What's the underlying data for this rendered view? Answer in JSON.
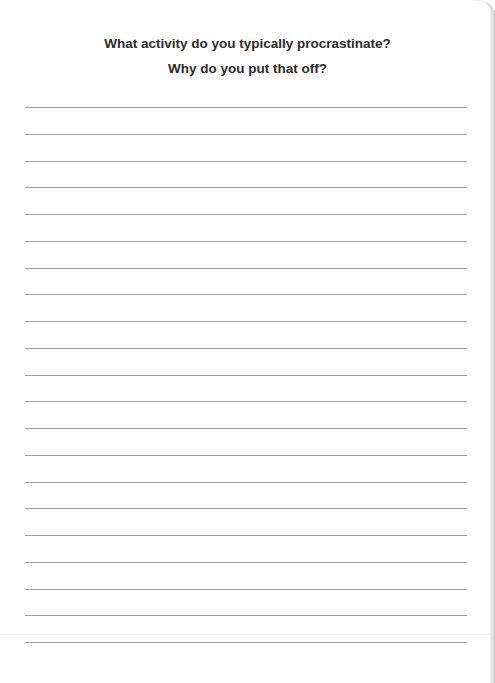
{
  "prompt": {
    "line1": "What activity do you typically procrastinate?",
    "line2": "Why do you put that off?"
  },
  "writing_area": {
    "line_count": 21,
    "first_line_y": 107,
    "line_spacing": 26.75,
    "line_color": "#9e9e9e"
  }
}
